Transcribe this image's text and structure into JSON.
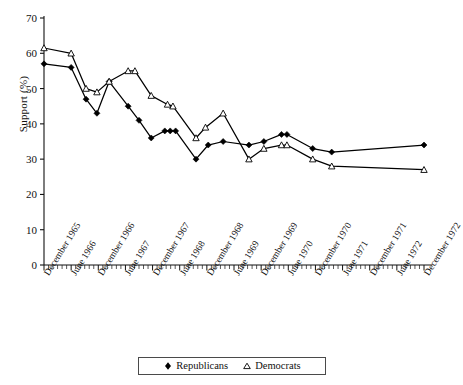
{
  "chart_data": {
    "type": "line",
    "title": "",
    "xlabel": "",
    "ylabel": "Support (%)",
    "ylim": [
      0,
      70
    ],
    "ytick_values": [
      0,
      10,
      20,
      30,
      40,
      50,
      60,
      70
    ],
    "ytick_labels": [
      "0",
      "10",
      "20",
      "30",
      "40",
      "50",
      "60",
      "70"
    ],
    "grid": false,
    "legend_position": "bottom-center",
    "x_tick_interval_note": "minor ticks monthly; major labeled ticks every 6 months",
    "categories": [
      "December 1965",
      "June 1966",
      "December 1966",
      "June 1967",
      "December 1967",
      "June 1968",
      "December 1968",
      "June 1969",
      "December 1969",
      "June 1970",
      "December 1970",
      "June 1971",
      "December 1971",
      "June 1972",
      "December 1972"
    ],
    "series": [
      {
        "name": "Republicans",
        "marker": "filled-diamond",
        "color": "#000000",
        "points": [
          {
            "x": 0.0,
            "y": 57
          },
          {
            "x": 1.0,
            "y": 56
          },
          {
            "x": 1.55,
            "y": 47
          },
          {
            "x": 1.95,
            "y": 43
          },
          {
            "x": 2.4,
            "y": 52
          },
          {
            "x": 3.1,
            "y": 45
          },
          {
            "x": 3.5,
            "y": 41
          },
          {
            "x": 3.95,
            "y": 36
          },
          {
            "x": 4.45,
            "y": 38
          },
          {
            "x": 4.65,
            "y": 38
          },
          {
            "x": 4.85,
            "y": 38
          },
          {
            "x": 5.6,
            "y": 30
          },
          {
            "x": 6.05,
            "y": 34
          },
          {
            "x": 6.6,
            "y": 35
          },
          {
            "x": 7.55,
            "y": 34
          },
          {
            "x": 8.1,
            "y": 35
          },
          {
            "x": 8.75,
            "y": 37
          },
          {
            "x": 8.95,
            "y": 37
          },
          {
            "x": 9.9,
            "y": 33
          },
          {
            "x": 10.6,
            "y": 32
          },
          {
            "x": 14.0,
            "y": 34
          }
        ]
      },
      {
        "name": "Democrats",
        "marker": "open-triangle",
        "color": "#000000",
        "points": [
          {
            "x": 0.0,
            "y": 61.5
          },
          {
            "x": 1.0,
            "y": 60
          },
          {
            "x": 1.55,
            "y": 50
          },
          {
            "x": 1.95,
            "y": 49
          },
          {
            "x": 2.4,
            "y": 52
          },
          {
            "x": 3.1,
            "y": 55
          },
          {
            "x": 3.35,
            "y": 55
          },
          {
            "x": 3.95,
            "y": 48
          },
          {
            "x": 4.55,
            "y": 45.5
          },
          {
            "x": 4.75,
            "y": 45
          },
          {
            "x": 5.6,
            "y": 36
          },
          {
            "x": 5.95,
            "y": 39
          },
          {
            "x": 6.6,
            "y": 43
          },
          {
            "x": 7.55,
            "y": 30
          },
          {
            "x": 8.1,
            "y": 33
          },
          {
            "x": 8.75,
            "y": 34
          },
          {
            "x": 8.95,
            "y": 34
          },
          {
            "x": 9.9,
            "y": 30
          },
          {
            "x": 10.6,
            "y": 28
          },
          {
            "x": 14.0,
            "y": 27
          }
        ]
      }
    ],
    "legend": [
      {
        "label": "Republicans",
        "marker": "filled-diamond"
      },
      {
        "label": "Democrats",
        "marker": "open-triangle"
      }
    ]
  }
}
